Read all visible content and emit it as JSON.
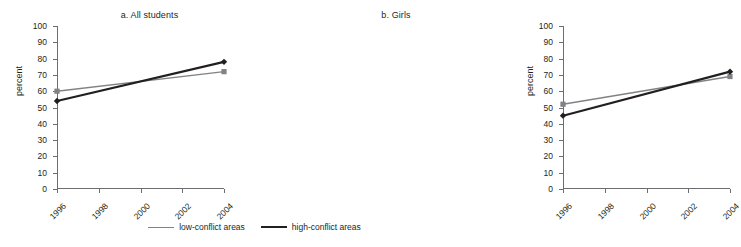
{
  "chart_data": [
    {
      "type": "line",
      "title": "a. All students",
      "xlabel": "",
      "ylabel": "percent",
      "x": [
        1996,
        2004
      ],
      "categories": [
        "1996",
        "1998",
        "2000",
        "2002",
        "2004"
      ],
      "xlim": [
        1996,
        2004
      ],
      "ylim": [
        0,
        100
      ],
      "yticks": [
        0,
        10,
        20,
        30,
        40,
        50,
        60,
        70,
        80,
        90,
        100
      ],
      "grid": false,
      "legend_position": "bottom-center",
      "series": [
        {
          "name": "low-conflict areas",
          "values": [
            60,
            72
          ],
          "color": "#808285",
          "marker": "square"
        },
        {
          "name": "high-conflict areas",
          "values": [
            54,
            78
          ],
          "color": "#231f20",
          "marker": "diamond"
        }
      ]
    },
    {
      "type": "line",
      "title": "b. Girls",
      "xlabel": "",
      "ylabel": "percent",
      "x": [
        1996,
        2004
      ],
      "categories": [
        "1996",
        "1998",
        "2000",
        "2002",
        "2004"
      ],
      "xlim": [
        1996,
        2004
      ],
      "ylim": [
        0,
        100
      ],
      "yticks": [
        0,
        10,
        20,
        30,
        40,
        50,
        60,
        70,
        80,
        90,
        100
      ],
      "grid": false,
      "legend_position": "bottom-center",
      "series": [
        {
          "name": "low-conflict areas",
          "values": [
            52,
            69
          ],
          "color": "#808285",
          "marker": "square"
        },
        {
          "name": "high-conflict areas",
          "values": [
            45,
            72
          ],
          "color": "#231f20",
          "marker": "diamond"
        }
      ]
    }
  ],
  "panel_a": {
    "title": "a. All students",
    "ylabel": "percent",
    "yticks": [
      "100",
      "90",
      "80",
      "70",
      "60",
      "50",
      "40",
      "30",
      "20",
      "10",
      "0"
    ],
    "xticks": [
      "1996",
      "1998",
      "2000",
      "2002",
      "2004"
    ]
  },
  "panel_b": {
    "title": "b. Girls",
    "ylabel": "percent",
    "yticks": [
      "100",
      "90",
      "80",
      "70",
      "60",
      "50",
      "40",
      "30",
      "20",
      "10",
      "0"
    ],
    "xticks": [
      "1996",
      "1998",
      "2000",
      "2002",
      "2004"
    ]
  },
  "legend": {
    "items": [
      {
        "label": "low-conflict areas",
        "color": "#808285"
      },
      {
        "label": "high-conflict areas",
        "color": "#231f20"
      }
    ]
  }
}
